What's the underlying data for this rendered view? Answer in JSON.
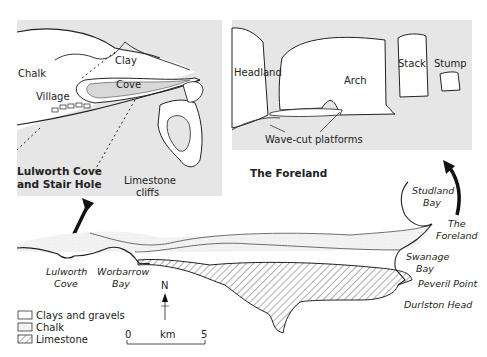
{
  "inset_left": {
    "title_line1": "Lulworth Cove",
    "title_line2": "and Stair Hole",
    "labels": {
      "chalk": "Chalk",
      "clay": "Clay",
      "cove": "Cove",
      "village": "Village",
      "limestone_line1": "Limestone",
      "limestone_line2": "cliffs"
    }
  },
  "inset_right": {
    "title": "The Foreland",
    "labels": {
      "headland": "Headland",
      "arch": "Arch",
      "stack": "Stack",
      "stump": "Stump",
      "platforms": "Wave-cut platforms"
    }
  },
  "map": {
    "places": {
      "lulworth_1": "Lulworth",
      "lulworth_2": "Cove",
      "worbarrow_1": "Worbarrow",
      "worbarrow_2": "Bay",
      "studland_1": "Studland",
      "studland_2": "Bay",
      "foreland_1": "The",
      "foreland_2": "Foreland",
      "swanage_1": "Swanage",
      "swanage_2": "Bay",
      "peveril": "Peveril Point",
      "durlston": "Durlston Head"
    },
    "north_label": "N",
    "scale": {
      "start": "0",
      "unit": "km",
      "end": "5"
    }
  },
  "legend": {
    "items": [
      {
        "label": "Clays and gravels",
        "pattern": "plain"
      },
      {
        "label": "Chalk",
        "pattern": "stipple"
      },
      {
        "label": "Limestone",
        "pattern": "hatch"
      }
    ]
  },
  "colors": {
    "inset_bg": "#e6e6e6",
    "ink": "#222222",
    "chalk_fill": "#f2f2f2"
  }
}
